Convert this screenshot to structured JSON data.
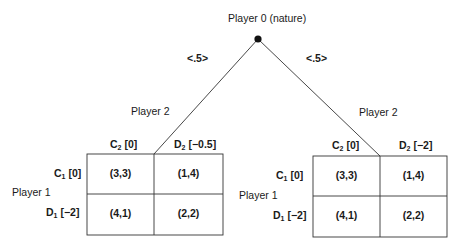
{
  "root": {
    "label": "Player 0 (nature)"
  },
  "branches": {
    "left_prob": "<.5>",
    "right_prob": "<.5>"
  },
  "left_game": {
    "column_player": "Player 2",
    "row_player": "Player 1",
    "columns": [
      {
        "letter": "C",
        "sub": "2",
        "bracket": " [0]"
      },
      {
        "letter": "D",
        "sub": "2",
        "bracket": " [−0.5]"
      }
    ],
    "rows": [
      {
        "letter": "C",
        "sub": "1",
        "bracket": " [0]"
      },
      {
        "letter": "D",
        "sub": "1",
        "bracket": " [−2]"
      }
    ],
    "cells": [
      [
        "(3,3)",
        "(1,4)"
      ],
      [
        "(4,1)",
        "(2,2)"
      ]
    ]
  },
  "right_game": {
    "column_player": "Player 2",
    "row_player": "Player 1",
    "columns": [
      {
        "letter": "C",
        "sub": "2",
        "bracket": " [0]"
      },
      {
        "letter": "D",
        "sub": "2",
        "bracket": " [−2]"
      }
    ],
    "rows": [
      {
        "letter": "C",
        "sub": "1",
        "bracket": " [0]"
      },
      {
        "letter": "D",
        "sub": "1",
        "bracket": " [−2]"
      }
    ],
    "cells": [
      [
        "(3,3)",
        "(1,4)"
      ],
      [
        "(4,1)",
        "(2,2)"
      ]
    ]
  }
}
